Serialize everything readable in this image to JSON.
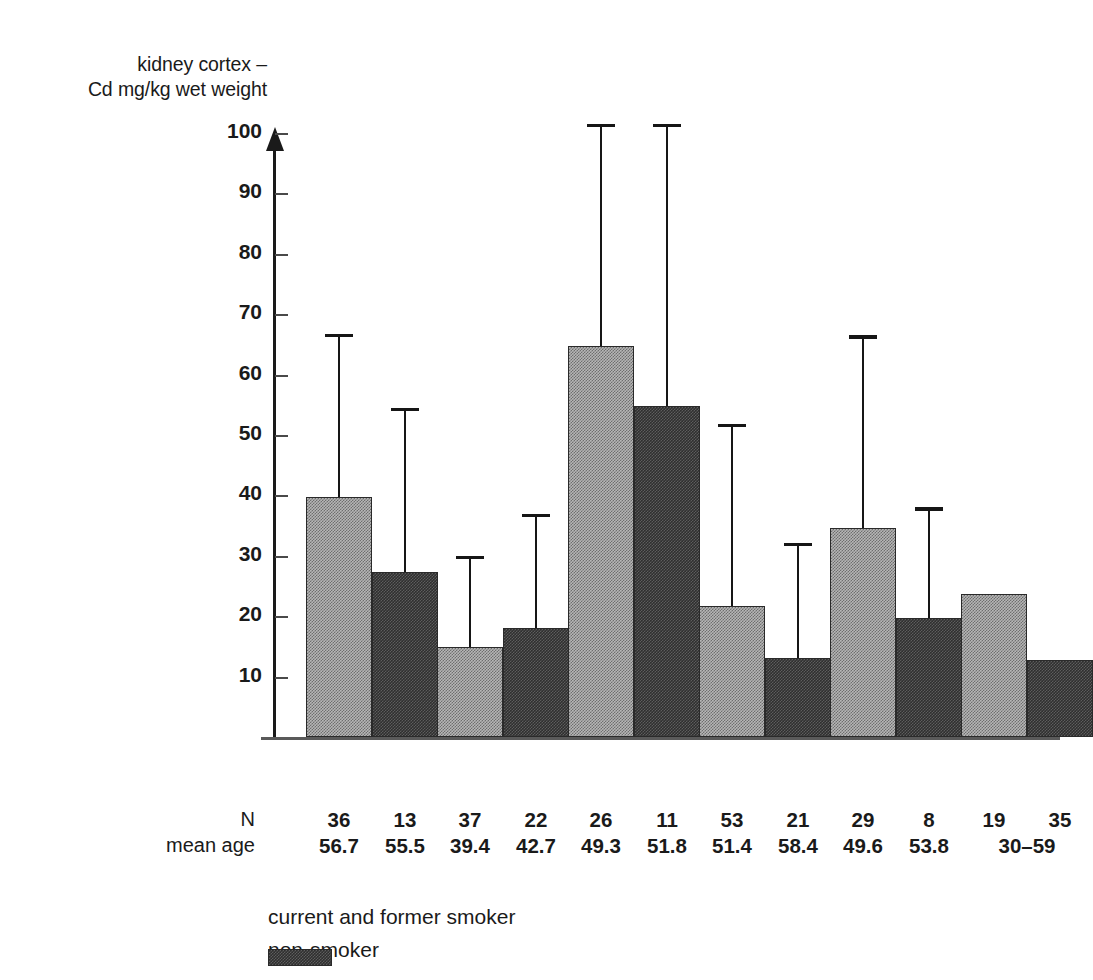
{
  "chart_data": {
    "type": "bar",
    "title": "",
    "ylabel": "kidney cortex –\nCd mg/kg wet weight",
    "xlabel": "",
    "ylim": [
      0,
      105
    ],
    "yticks": [
      10,
      20,
      30,
      40,
      50,
      60,
      70,
      80,
      90,
      100
    ],
    "ytick_labels": [
      "10",
      "20",
      "30",
      "40",
      "50",
      "60",
      "70",
      "80",
      "90",
      "100"
    ],
    "grid": false,
    "legend_position": "bottom-left",
    "categories": [
      "Belgium",
      "India",
      "Japan",
      "Sweden",
      "former\nYugoslavia",
      "USA"
    ],
    "series": [
      {
        "name": "current and former smoker",
        "color": "#b6b6b6",
        "values": [
          39.8,
          14.9,
          64.7,
          21.7,
          34.6,
          23.6
        ],
        "error_upper": [
          66.8,
          30.0,
          101.5,
          51.9,
          66.5,
          null
        ]
      },
      {
        "name": "non-smoker",
        "color": "#2f2f2f",
        "values": [
          27.3,
          18.0,
          54.8,
          13.0,
          19.7,
          12.7
        ],
        "error_upper": [
          54.5,
          37.0,
          101.5,
          32.2,
          38.0,
          null
        ]
      }
    ],
    "annotations": {
      "row_labels": [
        "N",
        "mean age"
      ],
      "n": [
        [
          "36",
          "13"
        ],
        [
          "37",
          "22"
        ],
        [
          "26",
          "11"
        ],
        [
          "53",
          "21"
        ],
        [
          "29",
          "8"
        ],
        [
          "19",
          "35"
        ]
      ],
      "mean_age": [
        [
          "56.7",
          "55.5"
        ],
        [
          "39.4",
          "42.7"
        ],
        [
          "49.3",
          "51.8"
        ],
        [
          "51.4",
          "58.4"
        ],
        [
          "49.6",
          "53.8"
        ],
        [
          "30–59"
        ]
      ]
    }
  },
  "axis": {
    "y_title": "kidney cortex –\nCd mg/kg wet weight",
    "ticks": [
      {
        "label": "100",
        "value": 100
      },
      {
        "label": "90",
        "value": 90
      },
      {
        "label": "80",
        "value": 80
      },
      {
        "label": "70",
        "value": 70
      },
      {
        "label": "60",
        "value": 60
      },
      {
        "label": "50",
        "value": 50
      },
      {
        "label": "40",
        "value": 40
      },
      {
        "label": "30",
        "value": 30
      },
      {
        "label": "20",
        "value": 20
      },
      {
        "label": "10",
        "value": 10
      }
    ]
  },
  "categories": [
    {
      "label": "Belgium"
    },
    {
      "label": "India"
    },
    {
      "label": "Japan"
    },
    {
      "label": "Sweden"
    },
    {
      "label": "former\nYugoslavia"
    },
    {
      "label": "USA"
    }
  ],
  "stats": {
    "row_label_n": "N",
    "row_label_age": "mean age",
    "columns": [
      {
        "n_light": "36",
        "n_dark": "13",
        "age_light": "56.7",
        "age_dark": "55.5"
      },
      {
        "n_light": "37",
        "n_dark": "22",
        "age_light": "39.4",
        "age_dark": "42.7"
      },
      {
        "n_light": "26",
        "n_dark": "11",
        "age_light": "49.3",
        "age_dark": "51.8"
      },
      {
        "n_light": "53",
        "n_dark": "21",
        "age_light": "51.4",
        "age_dark": "58.4"
      },
      {
        "n_light": "29",
        "n_dark": "8",
        "age_light": "49.6",
        "age_dark": "53.8"
      },
      {
        "n_light": "19",
        "n_dark": "35",
        "age_span": "30–59"
      }
    ]
  },
  "legend": {
    "items": [
      {
        "label": "current and former smoker",
        "style": "light"
      },
      {
        "label": "non-smoker",
        "style": "dark"
      }
    ]
  }
}
